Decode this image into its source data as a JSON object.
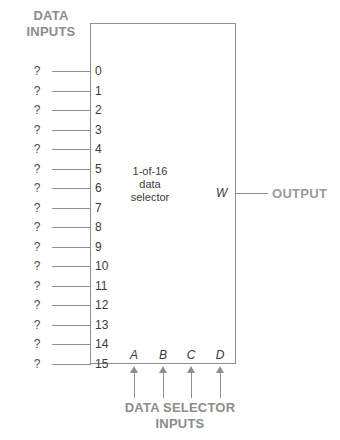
{
  "diagram": {
    "title_block": {
      "data_inputs_heading": "DATA\nINPUTS",
      "selector_inputs_caption": "DATA SELECTOR\nINPUTS",
      "output_label": "OUTPUT"
    },
    "chip": {
      "function_label": "1-of-16\ndata\nselector",
      "output_pin_label": "W",
      "data_pins": [
        {
          "number": "0",
          "value": "?"
        },
        {
          "number": "1",
          "value": "?"
        },
        {
          "number": "2",
          "value": "?"
        },
        {
          "number": "3",
          "value": "?"
        },
        {
          "number": "4",
          "value": "?"
        },
        {
          "number": "5",
          "value": "?"
        },
        {
          "number": "6",
          "value": "?"
        },
        {
          "number": "7",
          "value": "?"
        },
        {
          "number": "8",
          "value": "?"
        },
        {
          "number": "9",
          "value": "?"
        },
        {
          "number": "10",
          "value": "?"
        },
        {
          "number": "11",
          "value": "?"
        },
        {
          "number": "12",
          "value": "?"
        },
        {
          "number": "13",
          "value": "?"
        },
        {
          "number": "14",
          "value": "?"
        },
        {
          "number": "15",
          "value": "?"
        }
      ],
      "select_pins": [
        {
          "label": "A"
        },
        {
          "label": "B"
        },
        {
          "label": "C"
        },
        {
          "label": "D"
        }
      ]
    },
    "colors": {
      "line": "#8e8e8e",
      "heading_text": "#8c8c8c",
      "body_text": "#3a3a3a",
      "background": "#ffffff"
    }
  }
}
